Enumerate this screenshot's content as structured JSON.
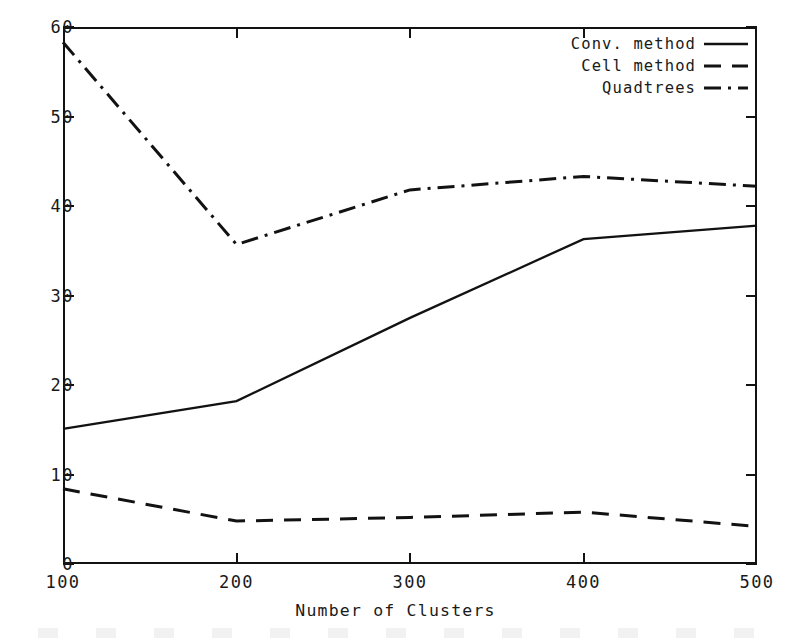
{
  "chart_data": {
    "type": "line",
    "title": "",
    "xlabel": "Number of Clusters",
    "ylabel": "",
    "x": [
      100,
      200,
      300,
      400,
      500
    ],
    "xticks": [
      "100",
      "200",
      "300",
      "400",
      "500"
    ],
    "yticks": [
      "0",
      "10",
      "20",
      "30",
      "40",
      "50",
      "60"
    ],
    "xlim": [
      100,
      500
    ],
    "ylim": [
      0,
      60
    ],
    "grid": false,
    "legend_position": "top-right",
    "series": [
      {
        "name": "Conv. method",
        "style": "solid",
        "values": [
          15.1,
          18.2,
          27.5,
          36.3,
          37.8
        ]
      },
      {
        "name": "Cell method",
        "style": "dashed",
        "values": [
          8.4,
          4.8,
          5.2,
          5.8,
          4.2
        ]
      },
      {
        "name": "Quadtrees",
        "style": "dash-dot",
        "values": [
          58.3,
          35.7,
          41.8,
          43.3,
          42.2
        ]
      }
    ],
    "line_color": "#121212",
    "axis_color": "#121212",
    "background_color": "#ffffff"
  }
}
